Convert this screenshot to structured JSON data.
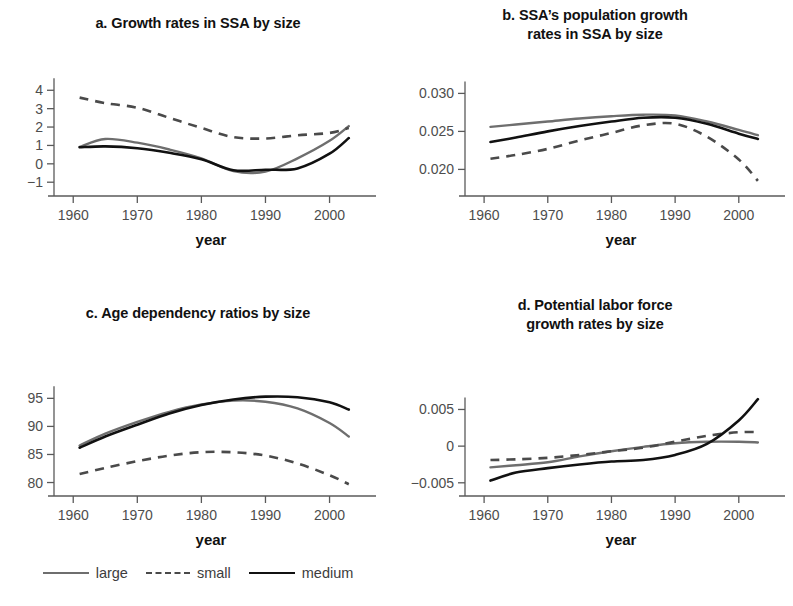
{
  "figure": {
    "axis_x_title": "year",
    "x_ticks": [
      1960,
      1970,
      1980,
      1990,
      2000
    ],
    "x_range": [
      1957,
      2006
    ],
    "legend": {
      "items": [
        {
          "key": "large",
          "label": "large",
          "style": "solid",
          "color": "#6e6e6e"
        },
        {
          "key": "small",
          "label": "small",
          "style": "dashed",
          "color": "#4a4a4a"
        },
        {
          "key": "medium",
          "label": "medium",
          "style": "solid",
          "color": "#111111"
        }
      ]
    }
  },
  "chart_data": [
    {
      "id": "a",
      "type": "line",
      "title": "a. Growth rates in SSA by size",
      "xlabel": "year",
      "ylabel": "",
      "xlim": [
        1957,
        2006
      ],
      "ylim": [
        -1.75,
        4.45
      ],
      "xticks": [
        1960,
        1970,
        1980,
        1990,
        2000
      ],
      "yticks": [
        -1,
        0,
        1,
        2,
        3,
        4
      ],
      "ytick_labels": [
        "−1",
        "0",
        "1",
        "2",
        "3",
        "4"
      ],
      "grid": false,
      "legend_position": "below-figure",
      "x": [
        1961,
        1965,
        1970,
        1975,
        1980,
        1985,
        1990,
        1995,
        2000,
        2003
      ],
      "series": [
        {
          "name": "large",
          "values": [
            0.92,
            1.35,
            1.15,
            0.78,
            0.3,
            -0.4,
            -0.42,
            0.3,
            1.25,
            2.05
          ]
        },
        {
          "name": "small",
          "values": [
            3.6,
            3.3,
            3.05,
            2.5,
            1.95,
            1.45,
            1.38,
            1.55,
            1.68,
            1.95
          ]
        },
        {
          "name": "medium",
          "values": [
            0.9,
            0.95,
            0.85,
            0.6,
            0.25,
            -0.35,
            -0.32,
            -0.25,
            0.55,
            1.4
          ]
        }
      ]
    },
    {
      "id": "b",
      "type": "line",
      "title": "b. SSA’s population growth rates in SSA by size",
      "title_lines": [
        "b. SSA’s population growth",
        "rates in SSA by size"
      ],
      "xlabel": "year",
      "ylabel": "",
      "xlim": [
        1957,
        2006
      ],
      "ylim": [
        0.0165,
        0.0315
      ],
      "xticks": [
        1960,
        1970,
        1980,
        1990,
        2000
      ],
      "yticks": [
        0.02,
        0.025,
        0.03
      ],
      "ytick_labels": [
        "0.020",
        "0.025",
        "0.030"
      ],
      "grid": false,
      "legend_position": "below-figure",
      "x": [
        1961,
        1965,
        1970,
        1975,
        1980,
        1985,
        1990,
        1995,
        2000,
        2003
      ],
      "series": [
        {
          "name": "large",
          "values": [
            0.0256,
            0.0259,
            0.0263,
            0.0267,
            0.027,
            0.0272,
            0.0271,
            0.0263,
            0.0252,
            0.0245
          ]
        },
        {
          "name": "small",
          "values": [
            0.0214,
            0.0219,
            0.0227,
            0.0238,
            0.0248,
            0.0258,
            0.026,
            0.0243,
            0.0213,
            0.0185
          ]
        },
        {
          "name": "medium",
          "values": [
            0.0236,
            0.0242,
            0.025,
            0.0257,
            0.0263,
            0.0268,
            0.0268,
            0.026,
            0.0247,
            0.024
          ]
        }
      ]
    },
    {
      "id": "c",
      "type": "line",
      "title": "c. Age dependency ratios by size",
      "xlabel": "year",
      "ylabel": "",
      "xlim": [
        1957,
        2006
      ],
      "ylim": [
        77.6,
        97.2
      ],
      "xticks": [
        1960,
        1970,
        1980,
        1990,
        2000
      ],
      "yticks": [
        80,
        85,
        90,
        95
      ],
      "ytick_labels": [
        "80",
        "85",
        "90",
        "95"
      ],
      "grid": false,
      "legend_position": "below-figure",
      "x": [
        1961,
        1965,
        1970,
        1975,
        1980,
        1985,
        1990,
        1995,
        2000,
        2003
      ],
      "series": [
        {
          "name": "large",
          "values": [
            86.6,
            88.7,
            90.8,
            92.6,
            93.9,
            94.6,
            94.4,
            93.2,
            90.6,
            88.2
          ]
        },
        {
          "name": "small",
          "values": [
            81.5,
            82.6,
            83.8,
            84.8,
            85.4,
            85.4,
            84.8,
            83.4,
            81.3,
            79.7
          ]
        },
        {
          "name": "medium",
          "values": [
            86.2,
            88.2,
            90.3,
            92.3,
            93.8,
            94.8,
            95.3,
            95.2,
            94.3,
            93.0
          ]
        }
      ]
    },
    {
      "id": "d",
      "type": "line",
      "title": "d. Potential labor force growth rates by size",
      "title_lines": [
        "d. Potential labor force",
        "growth rates by size"
      ],
      "xlabel": "year",
      "ylabel": "",
      "xlim": [
        1957,
        2006
      ],
      "ylim": [
        -0.0068,
        0.0082
      ],
      "xticks": [
        1960,
        1970,
        1980,
        1990,
        2000
      ],
      "yticks": [
        -0.005,
        0,
        0.005
      ],
      "ytick_labels": [
        "−0.005",
        "0",
        "0.005"
      ],
      "grid": false,
      "legend_position": "below-figure",
      "x": [
        1961,
        1965,
        1970,
        1975,
        1980,
        1985,
        1990,
        1995,
        2000,
        2003
      ],
      "series": [
        {
          "name": "large",
          "values": [
            -0.0029,
            -0.0026,
            -0.0022,
            -0.0014,
            -0.0007,
            -0.0001,
            0.0004,
            0.0006,
            0.0006,
            0.0005
          ]
        },
        {
          "name": "small",
          "values": [
            -0.0019,
            -0.0018,
            -0.0016,
            -0.0012,
            -0.0007,
            -0.0002,
            0.0006,
            0.0014,
            0.0019,
            0.0019
          ]
        },
        {
          "name": "medium",
          "values": [
            -0.0047,
            -0.0036,
            -0.003,
            -0.0025,
            -0.0021,
            -0.0019,
            -0.0012,
            0.0003,
            0.0035,
            0.0064
          ]
        }
      ]
    }
  ]
}
